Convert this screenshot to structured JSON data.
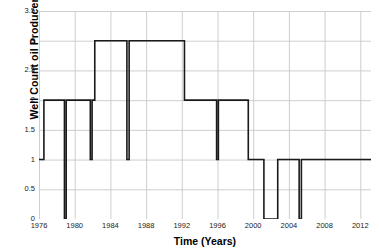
{
  "chart_data": {
    "type": "line",
    "title": "",
    "xlabel": "Time (Years)",
    "ylabel": "Well Count oil Producers",
    "xlim": [
      1976,
      2013.2
    ],
    "ylim": [
      0,
      3.5
    ],
    "grid": true,
    "legend": null,
    "line_color": "#1a1a1a",
    "grid_color": "#c8c8c8",
    "xticks": [
      1976,
      1980,
      1984,
      1988,
      1992,
      1996,
      2000,
      2004,
      2008,
      2012
    ],
    "xtick_labels": [
      "1976",
      "1980",
      "1984",
      "1988",
      "1992",
      "1996",
      "2000",
      "2004",
      "2008",
      "2012"
    ],
    "yticks": [
      0,
      0.5,
      1,
      1.5,
      2,
      2.5,
      3,
      3.5
    ],
    "ytick_labels": [
      "0",
      "0.5",
      "1",
      "1.5",
      "2",
      "2.5",
      "3",
      "3.5"
    ],
    "series": [
      {
        "name": "Well Count oil Producers",
        "step": "post",
        "x": [
          1976.0,
          1976.55,
          1978.85,
          1979.05,
          1981.75,
          1981.95,
          1982.25,
          1985.85,
          1986.1,
          1992.3,
          1995.9,
          1996.1,
          1999.45,
          2001.2,
          2002.75,
          2005.15,
          2005.4,
          2013.2
        ],
        "y": [
          1,
          2,
          0,
          2,
          1,
          2,
          3,
          1,
          3,
          2,
          1,
          2,
          1,
          0,
          1,
          0,
          1,
          1
        ]
      }
    ]
  }
}
